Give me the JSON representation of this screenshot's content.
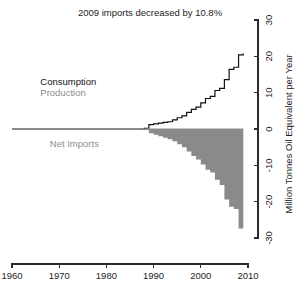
{
  "chart_data": {
    "type": "area",
    "title": "2009 imports decreased by 10.8%",
    "xlabel": "",
    "ylabel": "Million Tonnes Oil Equivalent per Year",
    "xlim": [
      1960,
      2010
    ],
    "ylim": [
      -30,
      30
    ],
    "xticks": [
      1960,
      1970,
      1980,
      1990,
      2000,
      2010
    ],
    "xtick_labels": [
      "1960",
      "1970",
      "1980",
      "1990",
      "2000",
      "2010"
    ],
    "yticks": [
      -30,
      -20,
      -10,
      0,
      10,
      20,
      30
    ],
    "ytick_labels": [
      "-30",
      "-20",
      "-10",
      "0",
      "10",
      "20",
      "30"
    ],
    "y_axis_side": "right",
    "grid": false,
    "legend_position": "inside-left",
    "annotations": [
      {
        "text": "Consumption",
        "color": "#111111",
        "x": 1966,
        "y": 12
      },
      {
        "text": "Production",
        "color": "#8d8d8d",
        "x": 1966,
        "y": 9
      },
      {
        "text": "Net Imports",
        "color": "#8d8d8d",
        "x": 1968,
        "y": -5
      }
    ],
    "series": [
      {
        "name": "Consumption",
        "color": "#111111",
        "render": "line",
        "x": [
          1960,
          1961,
          1962,
          1963,
          1964,
          1965,
          1966,
          1967,
          1968,
          1969,
          1970,
          1971,
          1972,
          1973,
          1974,
          1975,
          1976,
          1977,
          1978,
          1979,
          1980,
          1981,
          1982,
          1983,
          1984,
          1985,
          1986,
          1987,
          1988,
          1989,
          1990,
          1991,
          1992,
          1993,
          1994,
          1995,
          1996,
          1997,
          1998,
          1999,
          2000,
          2001,
          2002,
          2003,
          2004,
          2005,
          2006,
          2007,
          2008,
          2009
        ],
        "values": [
          0,
          0,
          0,
          0,
          0,
          0,
          0,
          0,
          0,
          0,
          0,
          0,
          0,
          0,
          0,
          0,
          0,
          0,
          0,
          0,
          0,
          0,
          0,
          0,
          0,
          0,
          0,
          0,
          0.2,
          1.2,
          1.4,
          1.6,
          1.8,
          2.0,
          2.5,
          3.1,
          3.6,
          4.6,
          5.4,
          6.0,
          7.2,
          8.4,
          9.0,
          10.6,
          11.2,
          13.6,
          16.4,
          17.0,
          20.4,
          20.8
        ]
      },
      {
        "name": "Production",
        "color": "#8d8d8d",
        "render": "line",
        "x": [
          1960,
          1970,
          1980,
          1985,
          1988,
          1990,
          1995,
          2000,
          2005,
          2009
        ],
        "values": [
          0,
          0,
          0,
          0,
          0,
          0,
          0,
          0,
          0,
          0
        ]
      },
      {
        "name": "Net Imports",
        "color": "#8a8a8a",
        "render": "area",
        "x": [
          1960,
          1961,
          1962,
          1963,
          1964,
          1965,
          1966,
          1967,
          1968,
          1969,
          1970,
          1971,
          1972,
          1973,
          1974,
          1975,
          1976,
          1977,
          1978,
          1979,
          1980,
          1981,
          1982,
          1983,
          1984,
          1985,
          1986,
          1987,
          1988,
          1989,
          1990,
          1991,
          1992,
          1993,
          1994,
          1995,
          1996,
          1997,
          1998,
          1999,
          2000,
          2001,
          2002,
          2003,
          2004,
          2005,
          2006,
          2007,
          2008,
          2009
        ],
        "values": [
          0,
          0,
          0,
          0,
          0,
          0,
          0,
          0,
          0,
          0,
          0,
          0,
          0,
          0,
          0,
          0,
          0,
          0,
          0,
          0,
          0,
          0,
          0,
          0,
          0,
          0,
          0,
          0,
          -0.2,
          -1.2,
          -1.6,
          -2.0,
          -2.4,
          -2.8,
          -3.4,
          -4.2,
          -5.0,
          -6.2,
          -7.4,
          -8.4,
          -9.8,
          -11.2,
          -12.0,
          -14.0,
          -15.4,
          -19.4,
          -21.4,
          -22.0,
          -27.4,
          -29.8
        ]
      }
    ]
  },
  "footer": {
    "caption": ""
  }
}
